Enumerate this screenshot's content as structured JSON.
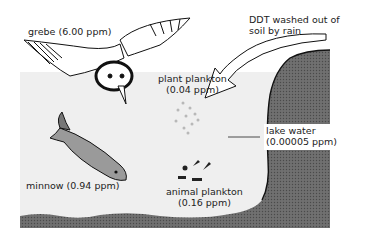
{
  "labels": {
    "grebe": "grebe (6.00 ppm)",
    "ddt_line1": "DDT washed out of",
    "ddt_line2": "soil by rain",
    "plant_line1": "plant plankton",
    "plant_line2": "(0.04 ppm)",
    "lake_line1": "lake water",
    "lake_line2": "(0.00005 ppm)",
    "minnow": "minnow (0.94 ppm)",
    "animal_line1": "animal plankton",
    "animal_line2": "(0.16 ppm)"
  },
  "colors": {
    "water": "#efefef",
    "soil": "#6e6e6e",
    "fish": "#9a9a9a",
    "ink": "#1a1a1a"
  }
}
